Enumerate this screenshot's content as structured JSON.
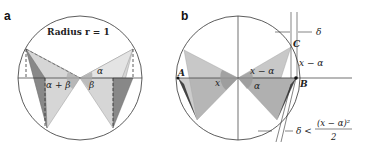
{
  "panel_a": {
    "label": "a",
    "title": "Radius r = 1",
    "angles": {
      "alpha_plus_beta": "α + β",
      "alpha": "α",
      "beta": "β",
      "beta_left": "β"
    }
  },
  "panel_b": {
    "label": "b",
    "points": {
      "A": "A",
      "B": "B",
      "C": "C"
    },
    "angles": {
      "x": "x",
      "x_minus_alpha": "x − α",
      "alpha": "α",
      "arc": "x − α"
    },
    "delta_top": "δ",
    "delta_bottom": "δ <",
    "fraction_num": "(x − α)²",
    "fraction_den": "2"
  },
  "colors": {
    "light": "#d4d4d4",
    "mid": "#a9a9a9",
    "dark": "#555555",
    "line": "#333333"
  }
}
